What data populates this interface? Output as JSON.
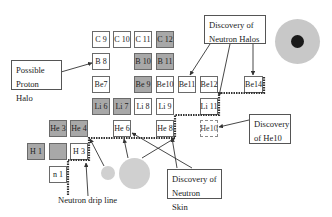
{
  "diagram": {
    "colors": {
      "stable_cell": "#a8a8a8",
      "unstable_cell": "#ffffff",
      "drip_line": "#333333",
      "halo_outer": "#c8c8c8",
      "halo_core": "#1a1a1a"
    },
    "cells": [
      {
        "id": "C9",
        "label": "C 9",
        "type": "unstable"
      },
      {
        "id": "C10",
        "label": "C 10",
        "type": "unstable"
      },
      {
        "id": "C11",
        "label": "C 11",
        "type": "unstable"
      },
      {
        "id": "C12",
        "label": "C 12",
        "type": "stable"
      },
      {
        "id": "B8",
        "label": "B 8",
        "type": "unstable"
      },
      {
        "id": "B10",
        "label": "B 10",
        "type": "stable"
      },
      {
        "id": "B11",
        "label": "B 11",
        "type": "stable"
      },
      {
        "id": "Be7",
        "label": "Be7",
        "type": "unstable"
      },
      {
        "id": "Be9",
        "label": "Be 9",
        "type": "stable"
      },
      {
        "id": "Be10",
        "label": "Be10",
        "type": "unstable"
      },
      {
        "id": "Be11",
        "label": "Be11",
        "type": "unstable"
      },
      {
        "id": "Be12",
        "label": "Be12",
        "type": "unstable"
      },
      {
        "id": "Be14",
        "label": "Be14",
        "type": "unstable"
      },
      {
        "id": "Li6",
        "label": "Li 6",
        "type": "stable"
      },
      {
        "id": "Li7",
        "label": "Li 7",
        "type": "stable"
      },
      {
        "id": "Li8",
        "label": "Li 8",
        "type": "unstable"
      },
      {
        "id": "Li9",
        "label": "Li 9",
        "type": "unstable"
      },
      {
        "id": "Li11",
        "label": "Li 11",
        "type": "unstable"
      },
      {
        "id": "He3",
        "label": "He 3",
        "type": "stable"
      },
      {
        "id": "He4",
        "label": "He 4",
        "type": "stable"
      },
      {
        "id": "He6",
        "label": "He 6",
        "type": "unstable"
      },
      {
        "id": "He8",
        "label": "He 8",
        "type": "unstable"
      },
      {
        "id": "He10",
        "label": "He10",
        "type": "dashed"
      },
      {
        "id": "H1",
        "label": "H 1",
        "type": "stable"
      },
      {
        "id": "H2",
        "label": "",
        "type": "stable"
      },
      {
        "id": "H3",
        "label": "H 3",
        "type": "unstable"
      },
      {
        "id": "n1",
        "label": "n 1",
        "type": "unstable"
      }
    ],
    "annotations": {
      "proton_halo": {
        "line1": "Possible",
        "line2": "Proton Halo"
      },
      "neutron_halos": {
        "line1": "Discovery of",
        "line2": "Neutron Halos"
      },
      "he10": {
        "line1": "Discovery",
        "line2": "of He10"
      },
      "neutron_skin": {
        "line1": "Discovery of",
        "line2": "Neutron Skin"
      },
      "drip_line": "Neutron drip line"
    }
  }
}
